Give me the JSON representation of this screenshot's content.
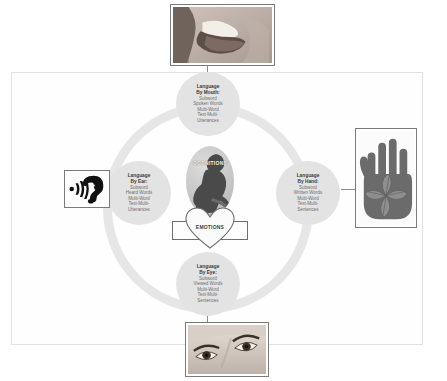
{
  "diagram": {
    "core": {
      "cognitions_label": "COGNITIONS",
      "emotions_label": "EMOTIONS",
      "cognitions_icon": "thinker-figure-icon",
      "emotions_icon": "heart-icon"
    },
    "nodes": [
      {
        "id": "mouth",
        "title_line1": "Language",
        "title_line2": "By Mouth:",
        "lines": [
          "Subword",
          "Spoken Words",
          "Multi-Word",
          "Text-Multi-",
          "Utterances"
        ]
      },
      {
        "id": "ear",
        "title_line1": "Language",
        "title_line2": "By Ear:",
        "lines": [
          "Subword",
          "Heard Words",
          "Multi-Word",
          "Text-Multi-",
          "Utterances"
        ]
      },
      {
        "id": "hand",
        "title_line1": "Language",
        "title_line2": "By Hand:",
        "lines": [
          "Subword",
          "Written Words",
          "Multi-Word",
          "Text-Multi-",
          "Sentences"
        ]
      },
      {
        "id": "eye",
        "title_line1": "Language",
        "title_line2": "By Eye:",
        "lines": [
          "Subword",
          "Viewed Words",
          "Multi-Word",
          "Text-Multi-",
          "Sentences"
        ]
      }
    ],
    "photos": [
      {
        "id": "mouth",
        "icon": "mouth-tongue-photo"
      },
      {
        "id": "ear",
        "icon": "ear-soundwaves-icon"
      },
      {
        "id": "hand",
        "icon": "hand-with-leaves-icon"
      },
      {
        "id": "eye",
        "icon": "eyes-photo"
      }
    ],
    "colors": {
      "node_fill": "#e3e3e3",
      "ring": "#e6e6e6",
      "frame_border": "#e2e2e2",
      "title_text": "#3a3a3a",
      "body_text": "#6d6d6d",
      "box_border": "#6f6f6f"
    }
  }
}
